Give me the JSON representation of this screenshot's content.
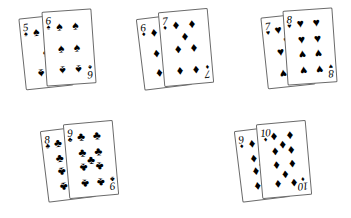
{
  "scene": {
    "description": "Five pairs of overlapping playing cards on a white background",
    "background_color": "#ffffff",
    "ink_color": "#000000",
    "card_border_color": "#6b6b6b",
    "card_face_color": "#ffffff",
    "layout": "two rows; three pairs on top row, two pairs on bottom row"
  },
  "suits": {
    "spade": {
      "name": "spade-suit",
      "glyph": "♠"
    },
    "heart": {
      "name": "heart-suit",
      "glyph": "♥"
    },
    "diamond": {
      "name": "diamond-suit",
      "glyph": "♦"
    },
    "club": {
      "name": "club-suit",
      "glyph": "♣"
    }
  },
  "pairs": [
    {
      "id": "pair-1",
      "position": {
        "left": 22,
        "top": 10
      },
      "back_card": {
        "rank": "5",
        "suit": "spade",
        "label": "5 of Spades",
        "rotate": -6,
        "left": 0,
        "top": 6,
        "width": 48,
        "height": 72
      },
      "front_card": {
        "rank": "6",
        "suit": "spade",
        "label": "6 of Spades",
        "rotate": -4,
        "left": 22,
        "top": 0,
        "width": 50,
        "height": 75
      }
    },
    {
      "id": "pair-2",
      "position": {
        "left": 140,
        "top": 10
      },
      "back_card": {
        "rank": "6",
        "suit": "diamond",
        "label": "6 of Diamonds",
        "rotate": -7,
        "left": 0,
        "top": 6,
        "width": 48,
        "height": 72
      },
      "front_card": {
        "rank": "7",
        "suit": "diamond",
        "label": "7 of Diamonds",
        "rotate": -5,
        "left": 21,
        "top": 0,
        "width": 50,
        "height": 75
      }
    },
    {
      "id": "pair-3",
      "position": {
        "left": 264,
        "top": 9
      },
      "back_card": {
        "rank": "7",
        "suit": "heart",
        "label": "7 of Hearts",
        "rotate": -6,
        "left": 0,
        "top": 6,
        "width": 48,
        "height": 72
      },
      "front_card": {
        "rank": "8",
        "suit": "heart",
        "label": "8 of Hearts",
        "rotate": -4,
        "left": 21,
        "top": 0,
        "width": 50,
        "height": 75
      }
    },
    {
      "id": "pair-4",
      "position": {
        "left": 44,
        "top": 122
      },
      "back_card": {
        "rank": "8",
        "suit": "club",
        "label": "8 of Clubs",
        "rotate": -7,
        "left": 0,
        "top": 6,
        "width": 48,
        "height": 72
      },
      "front_card": {
        "rank": "9",
        "suit": "club",
        "label": "9 of Clubs",
        "rotate": -5,
        "left": 22,
        "top": 0,
        "width": 50,
        "height": 75
      }
    },
    {
      "id": "pair-5",
      "position": {
        "left": 238,
        "top": 122
      },
      "back_card": {
        "rank": "9",
        "suit": "diamond",
        "label": "9 of Diamonds",
        "rotate": -7,
        "left": 0,
        "top": 6,
        "width": 48,
        "height": 72
      },
      "front_card": {
        "rank": "10",
        "suit": "diamond",
        "label": "10 of Diamonds",
        "rotate": -5,
        "left": 21,
        "top": 0,
        "width": 50,
        "height": 75
      }
    }
  ],
  "pip_layouts": {
    "5": [
      [
        25,
        10
      ],
      [
        75,
        10
      ],
      [
        50,
        50
      ],
      [
        25,
        90
      ],
      [
        75,
        90
      ]
    ],
    "6": [
      [
        25,
        10
      ],
      [
        75,
        10
      ],
      [
        25,
        50
      ],
      [
        75,
        50
      ],
      [
        25,
        90
      ],
      [
        75,
        90
      ]
    ],
    "7": [
      [
        25,
        8
      ],
      [
        75,
        8
      ],
      [
        50,
        29
      ],
      [
        25,
        50
      ],
      [
        75,
        50
      ],
      [
        25,
        92
      ],
      [
        75,
        92
      ]
    ],
    "8": [
      [
        25,
        8
      ],
      [
        75,
        8
      ],
      [
        25,
        36
      ],
      [
        75,
        36
      ],
      [
        25,
        64
      ],
      [
        75,
        64
      ],
      [
        25,
        92
      ],
      [
        75,
        92
      ]
    ],
    "9": [
      [
        25,
        8
      ],
      [
        75,
        8
      ],
      [
        25,
        36
      ],
      [
        75,
        36
      ],
      [
        50,
        50
      ],
      [
        25,
        64
      ],
      [
        75,
        64
      ],
      [
        25,
        92
      ],
      [
        75,
        92
      ]
    ],
    "10": [
      [
        25,
        6
      ],
      [
        75,
        6
      ],
      [
        50,
        21
      ],
      [
        25,
        33
      ],
      [
        75,
        33
      ],
      [
        25,
        60
      ],
      [
        75,
        60
      ],
      [
        50,
        78
      ],
      [
        25,
        94
      ],
      [
        75,
        94
      ]
    ]
  }
}
